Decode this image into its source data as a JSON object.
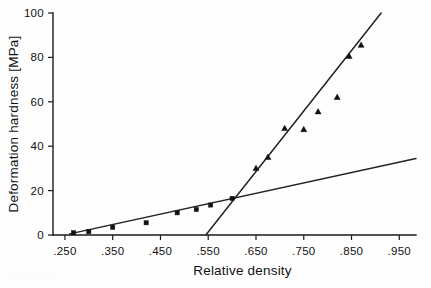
{
  "chart_data": {
    "type": "scatter",
    "title": "",
    "xlabel": "Relative density",
    "ylabel": "Deformation hardness [MPa]",
    "xlim": [
      0.225,
      0.985
    ],
    "ylim": [
      0,
      100
    ],
    "xticks": [
      0.25,
      0.35,
      0.45,
      0.55,
      0.65,
      0.75,
      0.85,
      0.95
    ],
    "xticklabels": [
      ".250",
      ".350",
      ".450",
      ".550",
      ".650",
      ".750",
      ".850",
      ".950"
    ],
    "yticks": [
      0,
      20,
      40,
      60,
      80,
      100
    ],
    "yticklabels": [
      "0",
      "20",
      "40",
      "60",
      "80",
      "100"
    ],
    "grid": false,
    "legend": "none",
    "series": [
      {
        "name": "low-density-squares",
        "marker": "square",
        "color": "#111111",
        "points": [
          {
            "x": 0.268,
            "y": 1.0
          },
          {
            "x": 0.3,
            "y": 1.5
          },
          {
            "x": 0.35,
            "y": 3.5
          },
          {
            "x": 0.42,
            "y": 5.5
          },
          {
            "x": 0.485,
            "y": 10.0
          },
          {
            "x": 0.525,
            "y": 11.5
          },
          {
            "x": 0.555,
            "y": 13.5
          },
          {
            "x": 0.6,
            "y": 16.5
          }
        ]
      },
      {
        "name": "high-density-triangles",
        "marker": "triangle",
        "color": "#111111",
        "points": [
          {
            "x": 0.65,
            "y": 30.0
          },
          {
            "x": 0.675,
            "y": 35.0
          },
          {
            "x": 0.71,
            "y": 48.0
          },
          {
            "x": 0.75,
            "y": 47.5
          },
          {
            "x": 0.78,
            "y": 55.5
          },
          {
            "x": 0.82,
            "y": 62.0
          },
          {
            "x": 0.845,
            "y": 80.5
          },
          {
            "x": 0.87,
            "y": 85.5
          }
        ]
      }
    ],
    "fit_lines": [
      {
        "name": "shallow-fit-line",
        "x0": 0.26,
        "y0": 0.5,
        "x1": 0.985,
        "y1": 34.5
      },
      {
        "name": "steep-fit-line",
        "x0": 0.545,
        "y0": 0.0,
        "x1": 0.912,
        "y1": 100.0
      }
    ]
  }
}
